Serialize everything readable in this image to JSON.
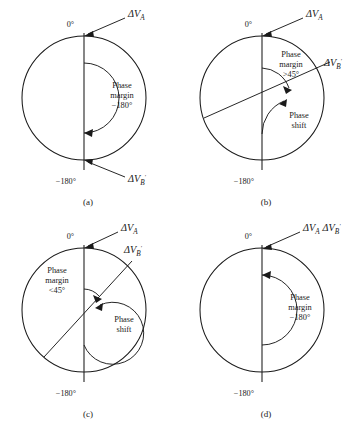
{
  "figure": {
    "background_color": "#ffffff",
    "line_color": "#1a1a1a"
  },
  "symbols": {
    "delta": "Δ",
    "degree": "°",
    "prime": "′",
    "minus": "−"
  },
  "panels": [
    {
      "id": "a",
      "caption": "(a)",
      "top_axis_label": "0°",
      "bottom_axis_label": "−180°",
      "vector_a_label": "ΔV",
      "vector_a_sub": "A",
      "vector_a_prime": "",
      "vector_b_label": "ΔV",
      "vector_b_sub": "B",
      "vector_b_prime": "′",
      "note_line1": "Phase",
      "note_line2": "margin",
      "note_line3": "−180°",
      "note2_line1": "",
      "note2_line2": "",
      "has_phase_shift_note": false,
      "has_vb_ray": false,
      "combined_vector_label": ""
    },
    {
      "id": "b",
      "caption": "(b)",
      "top_axis_label": "0°",
      "bottom_axis_label": "−180°",
      "vector_a_label": "ΔV",
      "vector_a_sub": "A",
      "vector_a_prime": "",
      "vector_b_label": "ΔV",
      "vector_b_sub": "B",
      "vector_b_prime": "′",
      "note_line1": "Phase",
      "note_line2": "margin",
      "note_line3": ">45°",
      "note2_line1": "Phase",
      "note2_line2": "shift",
      "has_phase_shift_note": true,
      "has_vb_ray": true,
      "combined_vector_label": ""
    },
    {
      "id": "c",
      "caption": "(c)",
      "top_axis_label": "0°",
      "bottom_axis_label": "−180°",
      "vector_a_label": "ΔV",
      "vector_a_sub": "A",
      "vector_a_prime": "",
      "vector_b_label": "ΔV",
      "vector_b_sub": "B",
      "vector_b_prime": "′",
      "note_line1": "Phase",
      "note_line2": "margin",
      "note_line3": "<45°",
      "note2_line1": "Phase",
      "note2_line2": "shift",
      "has_phase_shift_note": true,
      "has_vb_ray": true,
      "combined_vector_label": ""
    },
    {
      "id": "d",
      "caption": "(d)",
      "top_axis_label": "0°",
      "bottom_axis_label": "−180°",
      "vector_a_label": "ΔV",
      "vector_a_sub": "A",
      "vector_a_prime": "",
      "vector_b_label": "ΔV",
      "vector_b_sub": "B",
      "vector_b_prime": "′",
      "note_line1": "Phase",
      "note_line2": "margin",
      "note_line3": "−180°",
      "note2_line1": "",
      "note2_line2": "",
      "has_phase_shift_note": false,
      "has_vb_ray": false,
      "combined_vector_label": "combined"
    }
  ]
}
